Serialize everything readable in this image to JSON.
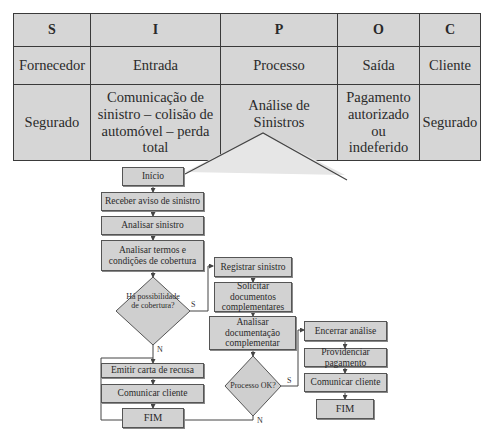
{
  "sipoc": {
    "headers": [
      "S",
      "I",
      "P",
      "O",
      "C"
    ],
    "labels": [
      "Fornecedor",
      "Entrada",
      "Processo",
      "Saída",
      "Cliente"
    ],
    "values": [
      "Segurado",
      "Comunicação de sinistro – colisão de automóvel – perda total",
      "Análise de Sinistros",
      "Pagamento autorizado ou indeferido",
      "Segurado"
    ]
  },
  "flow": {
    "inicio": "Início",
    "receber": "Receber aviso de sinistro",
    "analisar": "Analisar sinistro",
    "termos": "Analisar termos e condições de cobertura",
    "decisao1": "Há possibilidade de cobertura?",
    "emitir": "Emitir carta de recusa",
    "comunicar1": "Comunicar cliente",
    "fim1": "FIM",
    "registrar": "Registrar sinistro",
    "solicitar": "Solicitar documentos complementares",
    "analisar_doc": "Analisar documentação complementar",
    "decisao2": "Processo OK?",
    "encerrar": "Encerrar análise",
    "providenciar": "Providenciar pagamento",
    "comunicar2": "Comunicar cliente",
    "fim2": "FIM",
    "yes": "S",
    "no": "N"
  }
}
